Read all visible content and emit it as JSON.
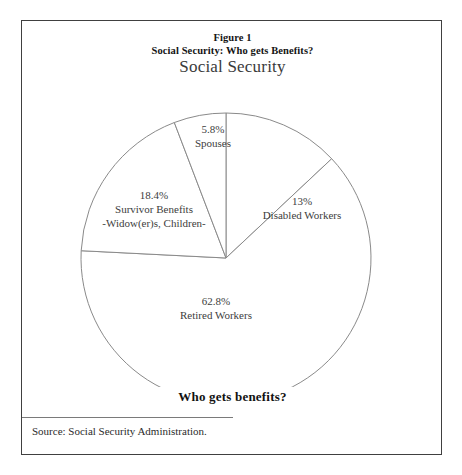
{
  "figure": {
    "heading_line1": "Figure 1",
    "heading_line2": "Social Security: Who gets Benefits?",
    "footer_caption": "Who gets benefits?",
    "source": "Source: Social Security Administration.",
    "border_color": "#404040",
    "rule_color": "#7a7a7a"
  },
  "chart_data": {
    "type": "pie",
    "title": "Social Security",
    "xlabel": "",
    "ylabel": "",
    "start_angle_deg": 0,
    "direction": "clockwise",
    "legend": "none",
    "grid": false,
    "slice_fill": "#ffffff",
    "slice_stroke": "#8a8a8a",
    "categories": [
      "Disabled Workers",
      "Retired Workers",
      "Survivor Benefits",
      "Spouses"
    ],
    "values": [
      13,
      62.8,
      18.4,
      5.8
    ],
    "slices": [
      {
        "label": "Disabled Workers",
        "value": 13,
        "value_text": "13%",
        "sublabel": "",
        "label_x": 280,
        "label_y": 148
      },
      {
        "label": "Retired Workers",
        "value": 62.8,
        "value_text": "62.8%",
        "sublabel": "",
        "label_x": 194,
        "label_y": 248
      },
      {
        "label": "Survivor Benefits",
        "value": 18.4,
        "value_text": "18.4%",
        "sublabel": "-Widow(er)s, Children-",
        "label_x": 132,
        "label_y": 142
      },
      {
        "label": "Spouses",
        "value": 5.8,
        "value_text": "5.8%",
        "sublabel": "",
        "label_x": 191,
        "label_y": 76
      }
    ]
  }
}
